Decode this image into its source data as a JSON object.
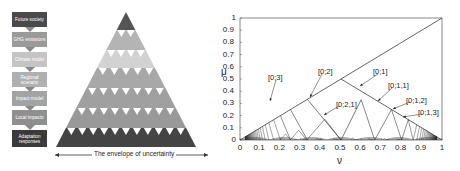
{
  "flow": {
    "boxes": [
      {
        "label": "Future society",
        "bg": "#4a4a4a",
        "top": 12,
        "height": 15
      },
      {
        "label": "GHG emissions",
        "bg": "#9a9a9a",
        "top": 32,
        "height": 15
      },
      {
        "label": "Climate model",
        "bg": "#c4c4c4",
        "top": 52,
        "height": 15
      },
      {
        "label": "Regional scenario",
        "bg": "#b0b0b0",
        "top": 72,
        "height": 15
      },
      {
        "label": "Impact model",
        "bg": "#a3a3a3",
        "top": 91,
        "height": 15
      },
      {
        "label": "Local impacts",
        "bg": "#8f8f8f",
        "top": 110,
        "height": 15
      },
      {
        "label": "Adaptation responses",
        "bg": "#3a3a3a",
        "top": 130,
        "height": 17
      }
    ]
  },
  "triangle": {
    "caption": "The envelope of uncertainty",
    "band_colors": [
      "#555555",
      "#b4b4b4",
      "#d2d2d2",
      "#a8a8a8",
      "#a0a0a0",
      "#999999",
      "#444444"
    ]
  },
  "plot": {
    "ylabel": "μ",
    "xlabel": "ν",
    "xticks": [
      "0",
      "0.1",
      "0.2",
      "0.3",
      "0.4",
      "0.5",
      "0.6",
      "0.7",
      "0.8",
      "0.9",
      "1"
    ],
    "yticks": [
      "0",
      "0.1",
      "0.2",
      "0.3",
      "0.4",
      "0.5",
      "0.6",
      "0.7",
      "0.8",
      "0.9",
      "1"
    ],
    "annotations": [
      {
        "label": "[0;3]",
        "x": 268,
        "y": 73
      },
      {
        "label": "[0;2]",
        "x": 318,
        "y": 67
      },
      {
        "label": "[0;1]",
        "x": 373,
        "y": 67
      },
      {
        "label": "[0;2,1]",
        "x": 336,
        "y": 100
      },
      {
        "label": "[0;1,1]",
        "x": 388,
        "y": 81
      },
      {
        "label": "[0;1,2]",
        "x": 406,
        "y": 96
      },
      {
        "label": "[0;1,3]",
        "x": 418,
        "y": 108
      }
    ]
  }
}
